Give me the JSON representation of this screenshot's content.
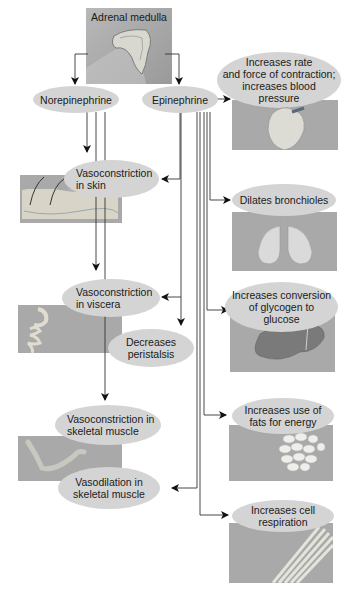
{
  "diagram": {
    "source": {
      "label": "Adrenal medulla",
      "icon": "adrenal-gland-illustration"
    },
    "hormones": [
      {
        "id": "norepinephrine",
        "label": "Norepinephrine"
      },
      {
        "id": "epinephrine",
        "label": "Epinephrine"
      }
    ],
    "effects_left": [
      {
        "id": "vasoconstriction-skin",
        "label": "Vasoconstriction\nin skin",
        "image": "skin-illustration",
        "from": [
          "norepinephrine",
          "epinephrine"
        ]
      },
      {
        "id": "vasoconstriction-viscera",
        "label": "Vasoconstriction\nin viscera",
        "image": "digestive-tract-illustration",
        "from": [
          "norepinephrine",
          "epinephrine"
        ]
      },
      {
        "id": "decreases-peristalsis",
        "label": "Decreases\nperistalsis",
        "from": [
          "epinephrine"
        ]
      },
      {
        "id": "vasoconstriction-skeletal",
        "label": "Vasoconstriction in\nskeletal muscle",
        "image": "arm-muscle-illustration",
        "from": [
          "norepinephrine"
        ]
      },
      {
        "id": "vasodilation-skeletal",
        "label": "Vasodilation in\nskeletal muscle",
        "from": [
          "epinephrine"
        ]
      }
    ],
    "effects_right": [
      {
        "id": "heart",
        "label": "Increases rate\nand force of contraction;\nincreases blood\npressure",
        "image": "heart-illustration",
        "from": [
          "epinephrine"
        ]
      },
      {
        "id": "bronchioles",
        "label": "Dilates bronchioles",
        "image": "lungs-illustration",
        "from": [
          "epinephrine"
        ]
      },
      {
        "id": "glycogen",
        "label": "Increases conversion\nof glycogen to\nglucose",
        "image": "liver-illustration",
        "from": [
          "epinephrine"
        ]
      },
      {
        "id": "fats",
        "label": "Increases use of\nfats for energy",
        "image": "fat-cells-illustration",
        "from": [
          "epinephrine"
        ]
      },
      {
        "id": "respiration",
        "label": "Increases cell\nrespiration",
        "image": "muscle-fibers-illustration",
        "from": [
          "epinephrine"
        ]
      }
    ],
    "colors": {
      "ellipse_fill": "#d4d4d4",
      "panel_fill": "#a9a9a9",
      "line": "#333333",
      "background": "#ffffff"
    }
  }
}
